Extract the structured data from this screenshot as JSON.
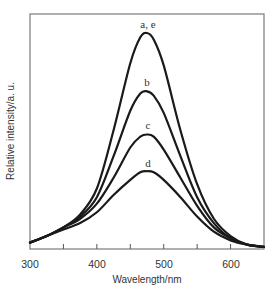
{
  "chart_data": {
    "type": "line",
    "title": "",
    "xlabel": "Wavelength/nm",
    "ylabel": "Relative intensity/a. u.",
    "xlim": [
      300,
      650
    ],
    "ylim": [
      0,
      1.08
    ],
    "xticks": [
      300,
      400,
      500,
      600
    ],
    "xminor_ticks": [
      350,
      450,
      550
    ],
    "yticks": [],
    "grid": false,
    "legend": "inline labels above peaks",
    "x": [
      300,
      325,
      350,
      375,
      400,
      425,
      450,
      465,
      475,
      485,
      500,
      525,
      550,
      575,
      600,
      625,
      650
    ],
    "series": [
      {
        "name": "a, e",
        "values": [
          0.03,
          0.06,
          0.1,
          0.16,
          0.28,
          0.55,
          0.86,
          0.98,
          1.0,
          0.97,
          0.85,
          0.55,
          0.3,
          0.14,
          0.06,
          0.02,
          0.01
        ]
      },
      {
        "name": "b",
        "values": [
          0.03,
          0.06,
          0.1,
          0.15,
          0.24,
          0.43,
          0.64,
          0.72,
          0.73,
          0.71,
          0.63,
          0.43,
          0.24,
          0.12,
          0.05,
          0.02,
          0.01
        ]
      },
      {
        "name": "c",
        "values": [
          0.03,
          0.06,
          0.1,
          0.14,
          0.21,
          0.33,
          0.47,
          0.52,
          0.53,
          0.52,
          0.46,
          0.33,
          0.2,
          0.1,
          0.05,
          0.02,
          0.01
        ]
      },
      {
        "name": "d",
        "values": [
          0.03,
          0.06,
          0.09,
          0.12,
          0.17,
          0.25,
          0.32,
          0.355,
          0.36,
          0.355,
          0.32,
          0.24,
          0.15,
          0.08,
          0.04,
          0.02,
          0.01
        ]
      }
    ],
    "annotations": [
      "a, e",
      "b",
      "c",
      "d"
    ]
  },
  "labels": {
    "xlabel": "Wavelength/nm",
    "ylabel": "Relative intensity/a. u.",
    "xtick_300": "300",
    "xtick_400": "400",
    "xtick_500": "500",
    "xtick_600": "600",
    "series_ae": "a, e",
    "series_b": "b",
    "series_c": "c",
    "series_d": "d"
  }
}
